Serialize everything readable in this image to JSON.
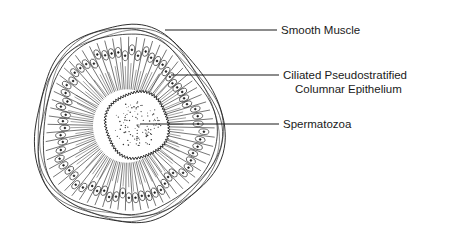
{
  "labels": {
    "smooth_muscle": "Smooth Muscle",
    "epithelium_line1": "Ciliated Pseudostratified",
    "epithelium_line2": "Columnar Epithelium",
    "spermatozoa": "Spermatozoa"
  },
  "structures": [
    {
      "name": "smooth-muscle",
      "label_key": "smooth_muscle"
    },
    {
      "name": "epithelium",
      "label_key": "epithelium"
    },
    {
      "name": "spermatozoa",
      "label_key": "spermatozoa"
    }
  ],
  "colors": {
    "ink": "#1a1a1a",
    "background": "#ffffff"
  }
}
